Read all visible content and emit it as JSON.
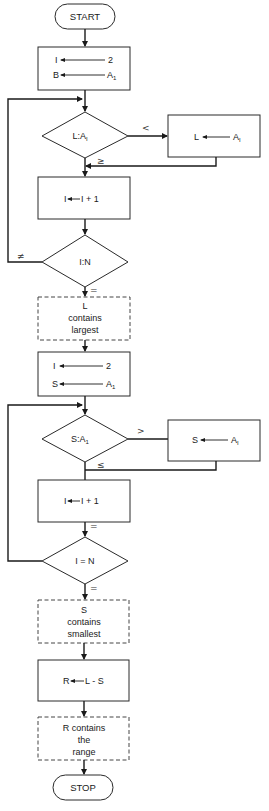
{
  "diagram": {
    "type": "flowchart",
    "colors": {
      "stroke": "#2a2a2a",
      "text": "#1a1a1a",
      "background": "#ffffff"
    },
    "start": {
      "label": "START"
    },
    "init_max": {
      "line1": {
        "target": "I",
        "source": "2"
      },
      "line2": {
        "target": "B",
        "source": "A",
        "source_sub": "1"
      }
    },
    "compare_max": {
      "label_left": "L:A",
      "label_sub": "I",
      "branch_lt": "<",
      "branch_ge": "≥"
    },
    "assign_max": {
      "target": "L",
      "source": "A",
      "source_sub": "I"
    },
    "increment_1": {
      "target": "I",
      "expr": "I + 1"
    },
    "test_1": {
      "label": "I:N",
      "branch_ne": "≠",
      "branch_eq": "="
    },
    "note_max": {
      "line1": "L",
      "line2": "contains",
      "line3": "largest"
    },
    "init_min": {
      "line1": {
        "target": "I",
        "source": "2"
      },
      "line2": {
        "target": "S",
        "source": "A",
        "source_sub": "1"
      }
    },
    "compare_min": {
      "label_left": "S:A",
      "label_sub": "1",
      "branch_gt": ">",
      "branch_le": "≤"
    },
    "assign_min": {
      "target": "S",
      "source": "A",
      "source_sub": "I"
    },
    "increment_2": {
      "target": "I",
      "expr": "I + 1",
      "branch_eq": "="
    },
    "test_2": {
      "label": "I = N",
      "branch_eq": "="
    },
    "note_min": {
      "line1": "S",
      "line2": "contains",
      "line3": "smallest"
    },
    "compute_range": {
      "target": "R",
      "expr": "L - S"
    },
    "note_range": {
      "line1": "R contains",
      "line2": "the",
      "line3": "range"
    },
    "stop": {
      "label": "STOP"
    }
  }
}
